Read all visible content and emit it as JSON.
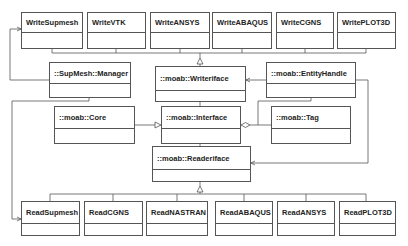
{
  "diagram": {
    "type": "UML class diagram",
    "writers": [
      {
        "id": "write-supmesh",
        "label": "WriteSupmesh",
        "x": 21,
        "y": 12,
        "w": 62,
        "h": 37
      },
      {
        "id": "write-vtk",
        "label": "WriteVTK",
        "x": 87,
        "y": 12,
        "w": 59,
        "h": 37
      },
      {
        "id": "write-ansys",
        "label": "WriteANSYS",
        "x": 150,
        "y": 12,
        "w": 60,
        "h": 37
      },
      {
        "id": "write-abaqus",
        "label": "WriteABAQUS",
        "x": 212,
        "y": 12,
        "w": 60,
        "h": 37
      },
      {
        "id": "write-cgns",
        "label": "WriteCGNS",
        "x": 276,
        "y": 12,
        "w": 58,
        "h": 37
      },
      {
        "id": "write-plot3d",
        "label": "WritePLOT3D",
        "x": 337,
        "y": 12,
        "w": 59,
        "h": 37
      }
    ],
    "core_classes": [
      {
        "id": "supmesh-manager",
        "label": "::SupMesh::Manager",
        "x": 49,
        "y": 62,
        "w": 82,
        "h": 36
      },
      {
        "id": "writer-iface",
        "label": "::moab::Writeriface",
        "x": 155,
        "y": 78,
        "w": 91,
        "h": 24
      },
      {
        "id": "entity-handle",
        "label": "::moab::EntityHandle",
        "x": 266,
        "y": 62,
        "w": 90,
        "h": 36
      },
      {
        "id": "moab-core",
        "label": "::moab::Core",
        "x": 54,
        "y": 106,
        "w": 81,
        "h": 38
      },
      {
        "id": "moab-interface",
        "label": "::moab::Interface",
        "x": 161,
        "y": 106,
        "w": 80,
        "h": 38
      },
      {
        "id": "moab-tag",
        "label": "::moab::Tag",
        "x": 271,
        "y": 106,
        "w": 80,
        "h": 38
      },
      {
        "id": "reader-iface",
        "label": "::moab::Readeriface",
        "x": 152,
        "y": 146,
        "w": 99,
        "h": 36
      }
    ],
    "readers": [
      {
        "id": "read-supmesh",
        "label": "ReadSupmesh",
        "x": 21,
        "y": 201,
        "w": 59,
        "h": 35
      },
      {
        "id": "read-cgns",
        "label": "ReadCGNS",
        "x": 84,
        "y": 201,
        "w": 59,
        "h": 35
      },
      {
        "id": "read-nastran",
        "label": "ReadNASTRAN",
        "x": 146,
        "y": 201,
        "w": 62,
        "h": 35
      },
      {
        "id": "read-abaqus",
        "label": "ReadABAQUS",
        "x": 215,
        "y": 201,
        "w": 58,
        "h": 35
      },
      {
        "id": "read-ansys",
        "label": "ReadANSYS",
        "x": 277,
        "y": 201,
        "w": 58,
        "h": 35
      },
      {
        "id": "read-plot3d",
        "label": "ReadPLOT3D",
        "x": 339,
        "y": 201,
        "w": 57,
        "h": 35
      }
    ],
    "relationships": [
      {
        "from": "Write* classes",
        "to": "::moab::Writeriface",
        "type": "generalization"
      },
      {
        "from": "Read* classes",
        "to": "::moab::Readeriface",
        "type": "generalization"
      },
      {
        "from": "::moab::Core",
        "to": "::moab::Interface",
        "type": "generalization"
      },
      {
        "from": "::moab::Tag",
        "to": "::moab::Interface",
        "type": "aggregation"
      },
      {
        "from": "::moab::EntityHandle",
        "to": "::moab::Interface",
        "type": "aggregation"
      },
      {
        "from": "::moab::EntityHandle",
        "to": "::moab::Writeriface",
        "type": "association"
      },
      {
        "from": "::moab::EntityHandle",
        "to": "::moab::Readeriface",
        "type": "association"
      },
      {
        "from": "::SupMesh::Manager",
        "to": "WriteSupmesh",
        "type": "association"
      },
      {
        "from": "::SupMesh::Manager",
        "to": "ReadSupmesh",
        "type": "association"
      }
    ],
    "colors": {
      "line": "#555555",
      "text": "#222222",
      "background": "#ffffff"
    }
  }
}
